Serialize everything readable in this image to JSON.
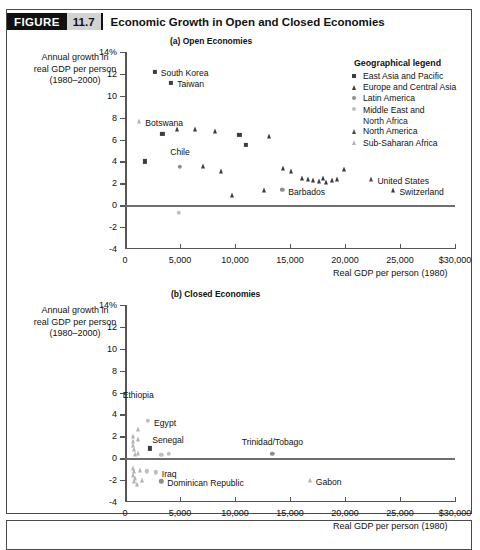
{
  "figure": {
    "label": "FIGURE",
    "number": "11.7",
    "title": "Economic Growth in Open and Closed Economies"
  },
  "axis_caption": {
    "y_line1": "Annual growth in",
    "y_line2": "real GDP per person",
    "y_line3": "(1980–2000)",
    "x": "Real GDP per person (1980)"
  },
  "legend": {
    "title": "Geographical legend",
    "items": [
      {
        "label": "East Asia and Pacific",
        "marker": "square-dark",
        "color": "#3d3d3d"
      },
      {
        "label": "Europe and Central Asia",
        "marker": "triangle-dark",
        "color": "#3d3d3d"
      },
      {
        "label": "Latin America",
        "marker": "circle-mid",
        "color": "#8e8e8e"
      },
      {
        "label": "Middle East and",
        "label2": "North Africa",
        "marker": "circle-light",
        "color": "#bdbdbd"
      },
      {
        "label": "North America",
        "marker": "triangle-dark",
        "color": "#4a4a4a"
      },
      {
        "label": "Sub-Saharan Africa",
        "marker": "triangle-light",
        "color": "#b4b4b4"
      }
    ]
  },
  "chart_data": [
    {
      "type": "scatter",
      "title": "(a) Open Economies",
      "xlabel": "Real GDP per person (1980)",
      "ylabel": "Annual growth in real GDP per person (1980–2000)",
      "xlim": [
        0,
        30000
      ],
      "ylim": [
        -4,
        14
      ],
      "xticks": [
        0,
        5000,
        10000,
        15000,
        20000,
        25000,
        30000
      ],
      "xticklabels": [
        "0",
        "5,000",
        "10,000",
        "15,000",
        "20,000",
        "25,000",
        "$30,000"
      ],
      "yticks": [
        -4,
        -2,
        0,
        2,
        4,
        6,
        8,
        10,
        12,
        14
      ],
      "yticklabels": [
        "-4",
        "-2",
        "0",
        "2",
        "4",
        "6",
        "8",
        "10",
        "12",
        "14%"
      ],
      "grid": false,
      "zeroline": true,
      "points": [
        {
          "name": "South Korea",
          "x": 2700,
          "y": 12.2,
          "group": "East Asia and Pacific",
          "label": "South Korea",
          "label_dx": 6,
          "label_dy": -0.15
        },
        {
          "name": "Taiwan",
          "x": 4200,
          "y": 11.2,
          "group": "East Asia and Pacific",
          "label": "Taiwan",
          "label_dx": 6,
          "label_dy": -0.15
        },
        {
          "name": "Botswana",
          "x": 1300,
          "y": 7.7,
          "group": "Sub-Saharan Africa",
          "label": "Botswana",
          "label_dx": 6,
          "label_dy": -0.15
        },
        {
          "name": "p1",
          "x": 3400,
          "y": 6.5,
          "group": "East Asia and Pacific"
        },
        {
          "name": "p2",
          "x": 4700,
          "y": 7.0,
          "group": "Europe and Central Asia"
        },
        {
          "name": "p3",
          "x": 6400,
          "y": 7.0,
          "group": "Europe and Central Asia"
        },
        {
          "name": "p4",
          "x": 8200,
          "y": 6.8,
          "group": "Europe and Central Asia"
        },
        {
          "name": "p5",
          "x": 10400,
          "y": 6.4,
          "group": "East Asia and Pacific"
        },
        {
          "name": "p6",
          "x": 11000,
          "y": 5.5,
          "group": "East Asia and Pacific"
        },
        {
          "name": "p7",
          "x": 13100,
          "y": 6.3,
          "group": "Europe and Central Asia"
        },
        {
          "name": "p8",
          "x": 1800,
          "y": 4.0,
          "group": "East Asia and Pacific"
        },
        {
          "name": "Chile",
          "x": 5000,
          "y": 3.5,
          "group": "Latin America",
          "label": "Chile",
          "label_dx": 0,
          "label_dy": 1.4,
          "label_align": "center"
        },
        {
          "name": "p9",
          "x": 7100,
          "y": 3.6,
          "group": "Europe and Central Asia"
        },
        {
          "name": "p10",
          "x": 8700,
          "y": 3.1,
          "group": "Europe and Central Asia"
        },
        {
          "name": "p11",
          "x": 9700,
          "y": 0.9,
          "group": "Europe and Central Asia"
        },
        {
          "name": "p12",
          "x": 14400,
          "y": 3.4,
          "group": "Europe and Central Asia"
        },
        {
          "name": "p13",
          "x": 15100,
          "y": 3.1,
          "group": "Europe and Central Asia"
        },
        {
          "name": "p14",
          "x": 16100,
          "y": 2.5,
          "group": "Europe and Central Asia"
        },
        {
          "name": "p15",
          "x": 16600,
          "y": 2.4,
          "group": "Europe and Central Asia"
        },
        {
          "name": "p16",
          "x": 17100,
          "y": 2.3,
          "group": "Europe and Central Asia"
        },
        {
          "name": "p17",
          "x": 17600,
          "y": 2.2,
          "group": "Europe and Central Asia"
        },
        {
          "name": "p18",
          "x": 18000,
          "y": 2.5,
          "group": "Europe and Central Asia"
        },
        {
          "name": "p19",
          "x": 18300,
          "y": 2.1,
          "group": "Europe and Central Asia"
        },
        {
          "name": "p20",
          "x": 18800,
          "y": 2.3,
          "group": "Europe and Central Asia"
        },
        {
          "name": "p21",
          "x": 19300,
          "y": 2.4,
          "group": "Europe and Central Asia"
        },
        {
          "name": "p22",
          "x": 19900,
          "y": 3.3,
          "group": "Europe and Central Asia"
        },
        {
          "name": "p23",
          "x": 12600,
          "y": 1.4,
          "group": "Europe and Central Asia"
        },
        {
          "name": "Barbados",
          "x": 14300,
          "y": 1.4,
          "group": "Latin America",
          "label": "Barbados",
          "label_dx": 6,
          "label_dy": -0.15
        },
        {
          "name": "p24",
          "x": 4900,
          "y": -0.7,
          "group": "Middle East and North Africa"
        },
        {
          "name": "United States",
          "x": 22400,
          "y": 2.4,
          "group": "North America",
          "label": "United States",
          "label_dx": 6,
          "label_dy": -0.15
        },
        {
          "name": "Switzerland",
          "x": 24400,
          "y": 1.4,
          "group": "Europe and Central Asia",
          "label": "Switzerland",
          "label_dx": 6,
          "label_dy": -0.15
        }
      ]
    },
    {
      "type": "scatter",
      "title": "(b) Closed Economies",
      "xlabel": "Real GDP per person (1980)",
      "ylabel": "Annual growth in real GDP per person (1980–2000)",
      "xlim": [
        0,
        30000
      ],
      "ylim": [
        -4,
        14
      ],
      "xticks": [
        0,
        5000,
        10000,
        15000,
        20000,
        25000,
        30000
      ],
      "xticklabels": [
        "0",
        "5,000",
        "10,000",
        "15,000",
        "20,000",
        "25,000",
        "$30,000"
      ],
      "yticks": [
        -4,
        -2,
        0,
        2,
        4,
        6,
        8,
        10,
        12,
        14
      ],
      "yticklabels": [
        "-4",
        "-2",
        "0",
        "2",
        "4",
        "6",
        "8",
        "10",
        "12",
        "14%"
      ],
      "grid": false,
      "zeroline": true,
      "points": [
        {
          "name": "Ethiopia",
          "x": 1200,
          "y": 2.7,
          "group": "Sub-Saharan Africa",
          "label": "Ethiopia",
          "label_dx": 0,
          "label_dy": 3.1,
          "label_align": "center"
        },
        {
          "name": "Egypt",
          "x": 2100,
          "y": 3.4,
          "group": "Middle East and North Africa",
          "label": "Egypt",
          "label_dx": 6,
          "label_dy": -0.15
        },
        {
          "name": "Senegal",
          "x": 1200,
          "y": 1.8,
          "group": "Sub-Saharan Africa",
          "label": "Senegal",
          "label_dx": 14,
          "label_dy": -0.15
        },
        {
          "name": "c1",
          "x": 700,
          "y": 2.0,
          "group": "Sub-Saharan Africa"
        },
        {
          "name": "c2",
          "x": 700,
          "y": 1.6,
          "group": "Sub-Saharan Africa"
        },
        {
          "name": "c3",
          "x": 750,
          "y": 1.2,
          "group": "Sub-Saharan Africa"
        },
        {
          "name": "c4",
          "x": 800,
          "y": 0.8,
          "group": "Sub-Saharan Africa"
        },
        {
          "name": "c5",
          "x": 900,
          "y": 0.4,
          "group": "Sub-Saharan Africa"
        },
        {
          "name": "c6",
          "x": 1200,
          "y": 0.5,
          "group": "Sub-Saharan Africa"
        },
        {
          "name": "c7",
          "x": 2300,
          "y": 0.9,
          "group": "East Asia and Pacific"
        },
        {
          "name": "c8",
          "x": 3300,
          "y": 0.3,
          "group": "Middle East and North Africa"
        },
        {
          "name": "c9",
          "x": 4000,
          "y": 0.4,
          "group": "Middle East and North Africa"
        },
        {
          "name": "Trinidad/Tobago",
          "x": 13400,
          "y": 0.4,
          "group": "Latin America",
          "label": "Trinidad/Tobago",
          "label_dx": 0,
          "label_dy": 1.1,
          "label_align": "center"
        },
        {
          "name": "c10",
          "x": 700,
          "y": -0.9,
          "group": "Sub-Saharan Africa"
        },
        {
          "name": "c11",
          "x": 800,
          "y": -1.2,
          "group": "Sub-Saharan Africa"
        },
        {
          "name": "c12",
          "x": 700,
          "y": -1.5,
          "group": "Sub-Saharan Africa"
        },
        {
          "name": "c13",
          "x": 900,
          "y": -1.8,
          "group": "Sub-Saharan Africa"
        },
        {
          "name": "c14",
          "x": 800,
          "y": -2.1,
          "group": "Sub-Saharan Africa"
        },
        {
          "name": "c15",
          "x": 1100,
          "y": -2.4,
          "group": "Sub-Saharan Africa"
        },
        {
          "name": "c16",
          "x": 1400,
          "y": -1.1,
          "group": "Sub-Saharan Africa"
        },
        {
          "name": "c17",
          "x": 1500,
          "y": -2.0,
          "group": "Sub-Saharan Africa"
        },
        {
          "name": "c18",
          "x": 2000,
          "y": -1.2,
          "group": "Middle East and North Africa"
        },
        {
          "name": "Iraq",
          "x": 2800,
          "y": -1.3,
          "group": "Middle East and North Africa",
          "label": "Iraq",
          "label_dx": 6,
          "label_dy": -0.15
        },
        {
          "name": "Dominican Republic",
          "x": 3300,
          "y": -2.1,
          "group": "Latin America",
          "label": "Dominican Republic",
          "label_dx": 6,
          "label_dy": -0.15
        },
        {
          "name": "Gabon",
          "x": 16800,
          "y": -2.0,
          "group": "Sub-Saharan Africa",
          "label": "Gabon",
          "label_dx": 6,
          "label_dy": -0.15
        }
      ]
    }
  ]
}
